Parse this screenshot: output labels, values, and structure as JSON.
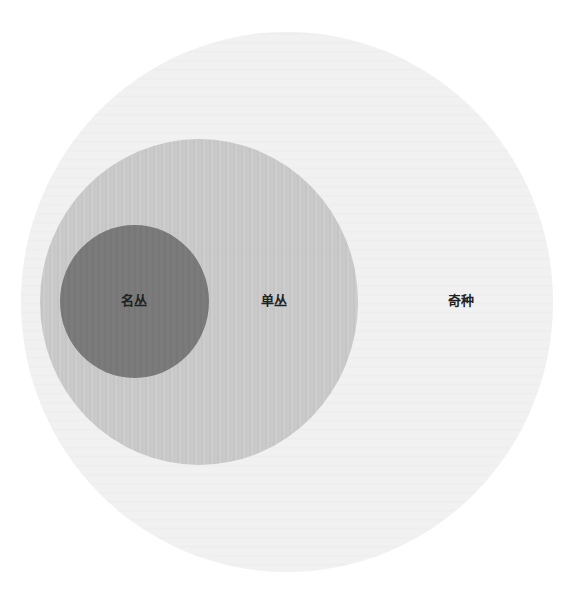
{
  "diagram": {
    "type": "nested-set-euler",
    "sets": [
      {
        "id": "outer",
        "label": "奇种",
        "fill": "#f1f1f1",
        "contains": [
          "middle"
        ]
      },
      {
        "id": "middle",
        "label": "单丛",
        "fill": "#c9c9c9",
        "contains": [
          "inner"
        ]
      },
      {
        "id": "inner",
        "label": "名丛",
        "fill": "#7a7a7a",
        "contains": []
      }
    ],
    "labels": {
      "outer": "奇种",
      "middle": "单丛",
      "inner": "名丛"
    }
  }
}
